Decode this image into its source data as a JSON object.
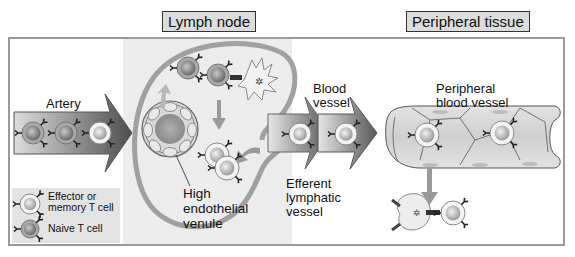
{
  "regions": {
    "lymph_node": "Lymph node",
    "peripheral_tissue": "Peripheral tissue"
  },
  "labels": {
    "artery": "Artery",
    "blood_vessel_line1": "Blood",
    "blood_vessel_line2": "vessel",
    "peripheral_blood_vessel_line1": "Peripheral",
    "peripheral_blood_vessel_line2": "blood vessel",
    "hev_line1": "High",
    "hev_line2": "endothelial",
    "hev_line3": "venule",
    "efferent_line1": "Efferent",
    "efferent_line2": "lymphatic",
    "efferent_line3": "vessel"
  },
  "legend": {
    "items": [
      {
        "label_line1": "Effector or",
        "label_line2": "memory T cell",
        "icon": "effector-t-cell-icon"
      },
      {
        "label_line1": "Naive T cell",
        "label_line2": "",
        "icon": "naive-t-cell-icon"
      }
    ]
  },
  "colors": {
    "lymph_band": "#ececec",
    "frame": "#9a9a9a",
    "title_bg": "#dcdcdc",
    "arrow_dark": "#5a5a5a",
    "arrow_light": "#d8d8d8",
    "node_capsule": "#9e9e9e"
  }
}
